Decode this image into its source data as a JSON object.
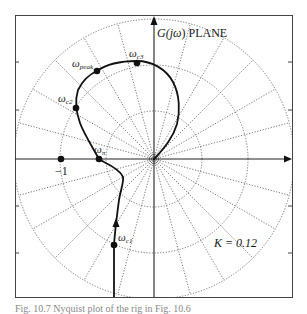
{
  "figure": {
    "title_prefix": "G(",
    "title_j": "j",
    "title_omega": "ω",
    "title_suffix": ") PLANE",
    "gain_label": "K = 0.12",
    "caption": "Fig. 10.7   Nyquist plot of the rig in Fig. 10.6"
  },
  "points": {
    "minus_one": {
      "label": "−1",
      "x": 61,
      "y": 159
    },
    "omega_pi": {
      "label": "ω",
      "sub": "π",
      "x": 99,
      "y": 159
    },
    "omega_c1": {
      "label": "ω",
      "sub": "c1",
      "x": 114,
      "y": 245
    },
    "omega_c2": {
      "label": "ω",
      "sub": "c2",
      "x": 76,
      "y": 108
    },
    "omega_peak": {
      "label": "ω",
      "sub": "peak",
      "x": 97,
      "y": 71
    },
    "omega_c3": {
      "label": "ω",
      "sub": "c3",
      "x": 137,
      "y": 63
    }
  },
  "grid": {
    "center": [
      154,
      159
    ],
    "circle_radii": [
      48,
      94,
      140
    ],
    "spoke_step_deg": 15
  },
  "colors": {
    "curve": "#111111",
    "grid": "#555555",
    "axis": "#222222",
    "frame": "#444444"
  }
}
